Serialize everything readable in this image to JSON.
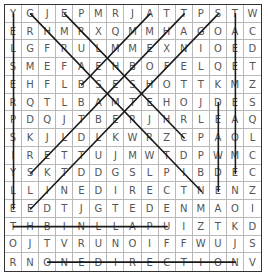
{
  "puzzle": {
    "rows": 15,
    "cols": 15,
    "grid": [
      "YGJEPMRJATTPSTW",
      "ERHMRXQMMHAGOAC",
      "LGFRULMMEXNIOED",
      "SMEFAEHBOFELQET",
      "EHFLBSESHOTTKMZ",
      "RQTLBAMTEHOJDES",
      "PDQJTBERJHRLEAQ",
      "SKJLDLKWRZCPAOL",
      "IRETTUJMWTDPWMC",
      "YSKTDDGSLPIBDEC",
      "LLINEDIRECTNENZ",
      "EEDTJGTEDENMAOI",
      "THBINLLAPUIZTKD",
      "OJTVRUNOIFFWUJS",
      "RNONEDIRECTIONV"
    ],
    "found_lines": [
      {
        "from": [
          0,
          0
        ],
        "to": [
          11,
          0
        ]
      },
      {
        "from": [
          0,
          1
        ],
        "to": [
          10,
          11
        ]
      },
      {
        "from": [
          0,
          3
        ],
        "to": [
          7,
          10
        ]
      },
      {
        "from": [
          0,
          8
        ],
        "to": [
          4,
          4
        ]
      },
      {
        "from": [
          0,
          10
        ],
        "to": [
          9,
          1
        ]
      },
      {
        "from": [
          0,
          12
        ],
        "to": [
          11,
          1
        ]
      },
      {
        "from": [
          0,
          13
        ],
        "to": [
          9,
          13
        ]
      },
      {
        "from": [
          5,
          12
        ],
        "to": [
          10,
          12
        ]
      },
      {
        "from": [
          12,
          0
        ],
        "to": [
          12,
          9
        ]
      },
      {
        "from": [
          14,
          2
        ],
        "to": [
          14,
          13
        ]
      }
    ],
    "line_color": "#1a1a1a"
  }
}
